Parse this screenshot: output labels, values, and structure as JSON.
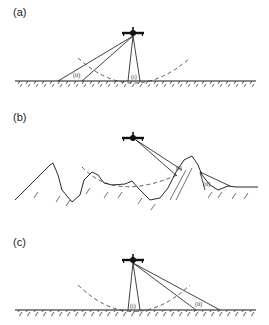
{
  "figure": {
    "panels": [
      {
        "id": "a",
        "label": "(a)",
        "beams": [
          {
            "label": "(i)",
            "type": "nadir-narrow"
          },
          {
            "label": "(ii)",
            "type": "oblique-wide"
          }
        ],
        "terrain": "flat"
      },
      {
        "id": "b",
        "label": "(b)",
        "beams": [
          {
            "label": "(i)",
            "type": "oblique-onto-slope"
          },
          {
            "label": "(ii)",
            "type": "oblique-into-valley"
          }
        ],
        "terrain": "mountainous"
      },
      {
        "id": "c",
        "label": "(c)",
        "beams": [
          {
            "label": "(i)",
            "type": "nadir-narrow"
          },
          {
            "label": "(ii)",
            "type": "oblique-wide"
          }
        ],
        "terrain": "flat"
      }
    ],
    "icons": {
      "aircraft": "aircraft-icon",
      "range_arc": "dashed-arc"
    },
    "colors": {
      "ink": "#111111",
      "background": "#ffffff"
    }
  }
}
